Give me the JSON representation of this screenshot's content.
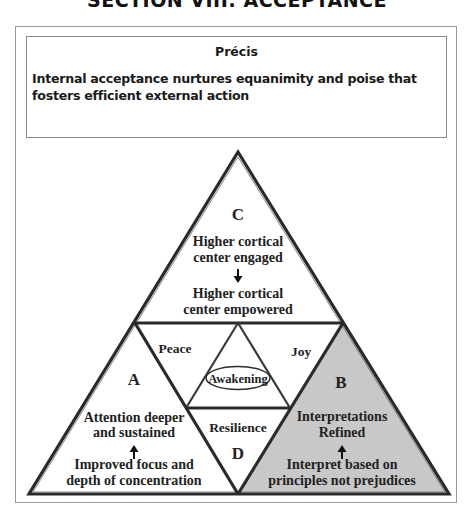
{
  "section_title": "SECTION VIII: ACCEPTANCE",
  "precis": {
    "heading": "Précis",
    "text": "Internal acceptance nurtures equanimity and poise that fosters efficient external action"
  },
  "diagram": {
    "colors": {
      "stroke": "#2a2a2a",
      "triangle_b_fill": "#c8c8c8",
      "background": "#ffffff"
    },
    "triangle_c": {
      "letter": "C",
      "line1": "Higher cortical",
      "line2": "center engaged",
      "arrow": "down-arrow",
      "line3": "Higher cortical",
      "line4": "center empowered"
    },
    "triangle_a": {
      "letter": "A",
      "line1": "Attention deeper",
      "line2": "and sustained",
      "arrow": "up-arrow",
      "line3": "Improved focus and",
      "line4": "depth of concentration"
    },
    "triangle_b": {
      "letter": "B",
      "line1": "Interpretations",
      "line2": "Refined",
      "arrow": "up-arrow",
      "line3": "Interpret based on",
      "line4": "principles not prejudices"
    },
    "triangle_d": {
      "letter": "D",
      "label": "Resilience"
    },
    "center": {
      "left_label": "Peace",
      "right_label": "Joy",
      "core_label": "Awakening"
    }
  }
}
